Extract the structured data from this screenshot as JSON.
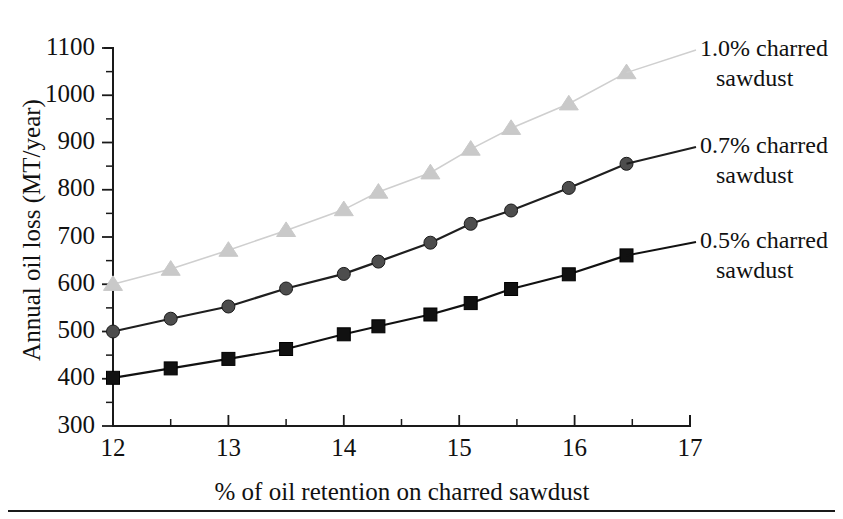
{
  "chart_data": {
    "type": "line",
    "title": "",
    "xlabel": "% of oil retention on charred sawdust",
    "ylabel": "Annual oil loss (MT/year)",
    "xlim": [
      12,
      17
    ],
    "ylim": [
      300,
      1100
    ],
    "x_major_ticks": [
      12,
      13,
      14,
      15,
      16,
      17
    ],
    "x_tick_labels": [
      "12",
      "13",
      "14",
      "15",
      "16",
      "17"
    ],
    "x_minor_step": 0.5,
    "y_major_ticks": [
      300,
      400,
      500,
      600,
      700,
      800,
      900,
      1000,
      1100
    ],
    "y_tick_labels": [
      "300",
      "400",
      "500",
      "600",
      "700",
      "800",
      "900",
      "1000",
      "1100"
    ],
    "y_minor_step": 50,
    "grid": false,
    "legend_position": "right-inline-annotations",
    "series": [
      {
        "name": "1.0% charred sawdust",
        "marker": "triangle",
        "color": "#c9c9c9",
        "line_color": "#cfcfcf",
        "x": [
          12,
          12.5,
          13,
          13.5,
          14,
          14.3,
          14.75,
          15.1,
          15.45,
          15.95,
          16.45
        ],
        "values": [
          600,
          632,
          672,
          714,
          758,
          795,
          836,
          886,
          930,
          982,
          1048
        ]
      },
      {
        "name": "0.7% charred sawdust",
        "marker": "circle",
        "color": "#4d4d4d",
        "line_color": "#1f1f1f",
        "x": [
          12,
          12.5,
          13,
          13.5,
          14,
          14.3,
          14.75,
          15.1,
          15.45,
          15.95,
          16.45
        ],
        "values": [
          500,
          527,
          553,
          591,
          622,
          648,
          688,
          728,
          756,
          804,
          855
        ]
      },
      {
        "name": "0.5% charred sawdust",
        "marker": "square",
        "color": "#111111",
        "line_color": "#111111",
        "x": [
          12,
          12.5,
          13,
          13.5,
          14,
          14.3,
          14.75,
          15.1,
          15.45,
          15.95,
          16.45
        ],
        "values": [
          402,
          422,
          442,
          463,
          494,
          511,
          536,
          560,
          590,
          621,
          661
        ]
      }
    ],
    "annotations": [
      {
        "id": "ann-1",
        "line1": "1.0% charred",
        "line2": "sawdust"
      },
      {
        "id": "ann-2",
        "line1": "0.7% charred",
        "line2": "sawdust"
      },
      {
        "id": "ann-3",
        "line1": "0.5% charred",
        "line2": "sawdust"
      }
    ]
  }
}
